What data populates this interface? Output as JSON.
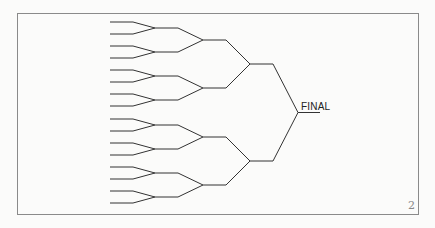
{
  "diagram": {
    "type": "tournament-bracket",
    "entrants": 16,
    "rounds": 4,
    "final_label": "FINAL",
    "page_number": "2",
    "line_color": "#333333",
    "frame_color": "#8a8a8a"
  }
}
